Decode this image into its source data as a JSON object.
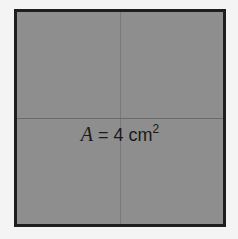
{
  "figure": {
    "shape": "square",
    "divisions": "2x2 grid of equal quarters",
    "fill_color": "#8e8e8e",
    "border_color": "#1e1e1e",
    "label": {
      "variable": "A",
      "equals": " = ",
      "value": "4",
      "unit": " cm",
      "exponent": "2"
    }
  }
}
